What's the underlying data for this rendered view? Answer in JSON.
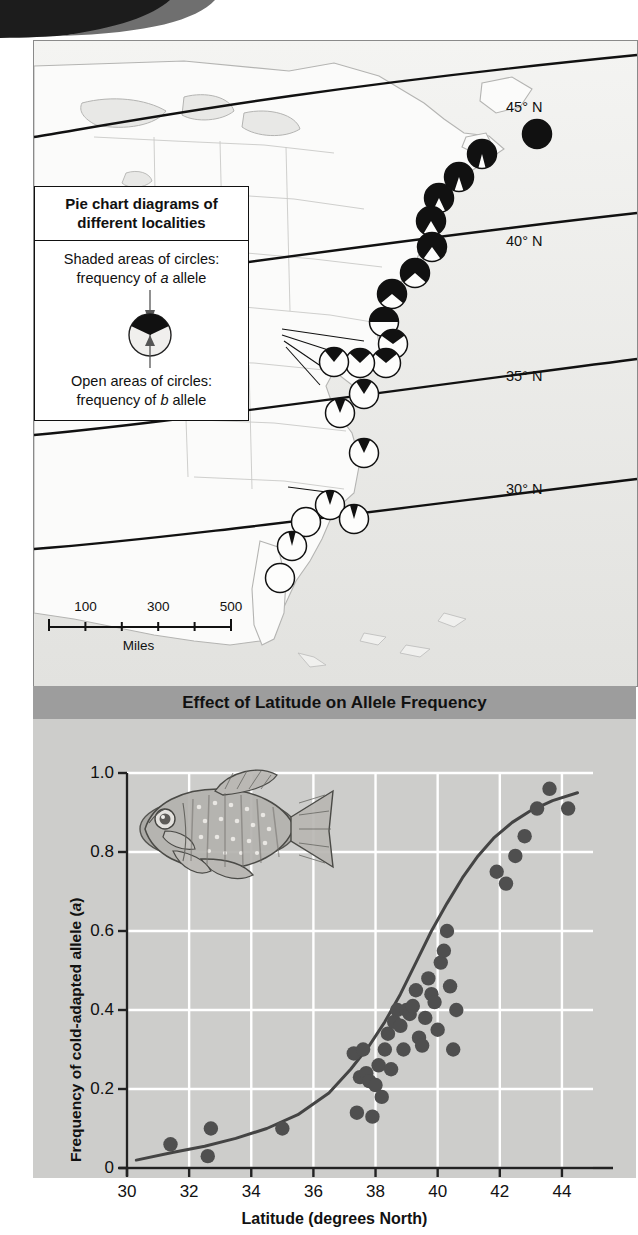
{
  "map": {
    "latitude_labels": [
      {
        "text": "45° N",
        "x": 472,
        "y": 58
      },
      {
        "text": "40° N",
        "x": 472,
        "y": 192
      },
      {
        "text": "35° N",
        "x": 472,
        "y": 327
      },
      {
        "text": "30° N",
        "x": 472,
        "y": 440
      }
    ],
    "legend": {
      "title_line1": "Pie chart diagrams of",
      "title_line2": "different localities",
      "shaded_line1": "Shaded areas of circles:",
      "shaded_line2_pre": "frequency of ",
      "shaded_allele": "a",
      "shaded_line2_post": " allele",
      "open_line1": "Open areas of circles:",
      "open_line2_pre": "frequency of ",
      "open_allele": "b",
      "open_line2_post": " allele",
      "sample_shaded_fraction": 0.22
    },
    "scale_bar": {
      "labels": [
        "100",
        "300",
        "500"
      ],
      "label_positions": [
        0.2,
        0.6,
        1.0
      ],
      "unit": "Miles",
      "tick_fractions": [
        0,
        0.2,
        0.4,
        0.6,
        0.8,
        1.0
      ]
    },
    "pie_markers": [
      {
        "x": 503,
        "y": 93,
        "r": 14.5,
        "shaded": 1.0
      },
      {
        "x": 448,
        "y": 113,
        "r": 14.5,
        "shaded": 0.92
      },
      {
        "x": 425,
        "y": 136,
        "r": 14.5,
        "shaded": 0.9
      },
      {
        "x": 405,
        "y": 157,
        "r": 14.5,
        "shaded": 0.86
      },
      {
        "x": 397,
        "y": 180,
        "r": 14.5,
        "shaded": 0.83
      },
      {
        "x": 398,
        "y": 206,
        "r": 14.5,
        "shaded": 0.8
      },
      {
        "x": 381,
        "y": 232,
        "r": 14.5,
        "shaded": 0.73
      },
      {
        "x": 358,
        "y": 253,
        "r": 14.5,
        "shaded": 0.72
      },
      {
        "x": 350,
        "y": 281,
        "r": 14.5,
        "shaded": 0.5
      },
      {
        "x": 359,
        "y": 303,
        "r": 14.5,
        "shaded": 0.3
      },
      {
        "x": 352,
        "y": 322,
        "r": 14.5,
        "shaded": 0.28
      },
      {
        "x": 326,
        "y": 322,
        "r": 14.5,
        "shaded": 0.26
      },
      {
        "x": 300,
        "y": 321,
        "r": 14.5,
        "shaded": 0.22
      },
      {
        "x": 330,
        "y": 353,
        "r": 14.5,
        "shaded": 0.18
      },
      {
        "x": 306,
        "y": 372,
        "r": 14.5,
        "shaded": 0.12
      },
      {
        "x": 330,
        "y": 412,
        "r": 14.5,
        "shaded": 0.14
      },
      {
        "x": 296,
        "y": 464,
        "r": 14.5,
        "shaded": 0.1
      },
      {
        "x": 320,
        "y": 478,
        "r": 14.5,
        "shaded": 0.09
      },
      {
        "x": 272,
        "y": 481,
        "r": 14.5,
        "shaded": 0.0
      },
      {
        "x": 258,
        "y": 505,
        "r": 14.5,
        "shaded": 0.08
      },
      {
        "x": 246,
        "y": 537,
        "r": 14.5,
        "shaded": 0.0
      }
    ]
  },
  "chart": {
    "banner_title": "Effect of Latitude on Allele Frequency",
    "ylabel_pre": "Frequency of cold-adapted allele (",
    "ylabel_italic": "a",
    "ylabel_post": ")",
    "xlabel": "Latitude (degrees North)",
    "background_color": "#cdcdcb",
    "gridline_color": "#ffffff",
    "point_color": "#4f4f4f",
    "curve_color": "#444444",
    "banner_color": "#9d9d9d"
  },
  "chart_data": {
    "type": "scatter",
    "title": "Effect of Latitude on Allele Frequency",
    "xlabel": "Latitude (degrees North)",
    "ylabel": "Frequency of cold-adapted allele (a)",
    "xlim": [
      30,
      45
    ],
    "ylim": [
      0,
      1.0
    ],
    "xticks": [
      30,
      32,
      34,
      36,
      38,
      40,
      42,
      44
    ],
    "yticks": [
      0,
      0.2,
      0.4,
      0.6,
      0.8,
      1.0
    ],
    "ytick_labels": [
      "0",
      "0.2",
      "0.4",
      "0.6",
      "0.8",
      "1.0"
    ],
    "grid": true,
    "legend": "none",
    "points": [
      [
        31.4,
        0.06
      ],
      [
        32.6,
        0.03
      ],
      [
        32.7,
        0.1
      ],
      [
        35.0,
        0.1
      ],
      [
        37.3,
        0.29
      ],
      [
        37.4,
        0.14
      ],
      [
        37.5,
        0.23
      ],
      [
        37.6,
        0.3
      ],
      [
        37.7,
        0.24
      ],
      [
        37.8,
        0.22
      ],
      [
        37.9,
        0.13
      ],
      [
        38.0,
        0.21
      ],
      [
        38.1,
        0.26
      ],
      [
        38.2,
        0.18
      ],
      [
        38.3,
        0.3
      ],
      [
        38.4,
        0.34
      ],
      [
        38.5,
        0.25
      ],
      [
        38.6,
        0.37
      ],
      [
        38.7,
        0.4
      ],
      [
        38.8,
        0.36
      ],
      [
        38.9,
        0.3
      ],
      [
        39.0,
        0.4
      ],
      [
        39.1,
        0.39
      ],
      [
        39.2,
        0.41
      ],
      [
        39.3,
        0.45
      ],
      [
        39.4,
        0.33
      ],
      [
        39.5,
        0.31
      ],
      [
        39.6,
        0.38
      ],
      [
        39.7,
        0.48
      ],
      [
        39.8,
        0.44
      ],
      [
        39.9,
        0.42
      ],
      [
        40.0,
        0.35
      ],
      [
        40.1,
        0.52
      ],
      [
        40.2,
        0.55
      ],
      [
        40.3,
        0.6
      ],
      [
        40.4,
        0.46
      ],
      [
        40.5,
        0.3
      ],
      [
        40.6,
        0.4
      ],
      [
        41.9,
        0.75
      ],
      [
        42.2,
        0.72
      ],
      [
        42.5,
        0.79
      ],
      [
        42.8,
        0.84
      ],
      [
        43.2,
        0.91
      ],
      [
        43.6,
        0.96
      ],
      [
        44.2,
        0.91
      ]
    ],
    "trend_curve": {
      "description": "logistic fit of allele frequency vs latitude",
      "points": [
        [
          30.3,
          0.02
        ],
        [
          31.5,
          0.04
        ],
        [
          32.5,
          0.055
        ],
        [
          33.5,
          0.075
        ],
        [
          34.5,
          0.1
        ],
        [
          35.5,
          0.135
        ],
        [
          36.5,
          0.19
        ],
        [
          37.2,
          0.25
        ],
        [
          37.8,
          0.31
        ],
        [
          38.3,
          0.37
        ],
        [
          38.8,
          0.44
        ],
        [
          39.3,
          0.52
        ],
        [
          39.8,
          0.6
        ],
        [
          40.3,
          0.67
        ],
        [
          40.8,
          0.735
        ],
        [
          41.3,
          0.79
        ],
        [
          41.8,
          0.835
        ],
        [
          42.4,
          0.875
        ],
        [
          43.0,
          0.905
        ],
        [
          43.7,
          0.93
        ],
        [
          44.5,
          0.95
        ]
      ]
    }
  }
}
